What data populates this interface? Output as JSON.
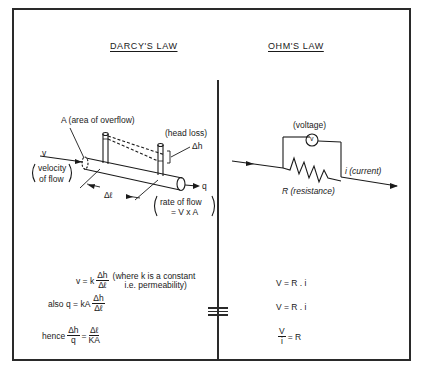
{
  "left_panel": {
    "title": "DARCY'S LAW",
    "labels": {
      "area": "A (area of overflow)",
      "head_loss": "(head loss)",
      "delta_h": "Δh",
      "velocity_symbol": "v",
      "velocity_desc_1": "velocity",
      "velocity_desc_2": "of flow",
      "delta_l": "Δℓ",
      "flow_symbol": "q",
      "flow_desc_1": "rate of flow",
      "flow_desc_2": "= V x A"
    },
    "equations": {
      "eq1_lhs": "v = k",
      "eq1_num": "Δh",
      "eq1_den": "Δℓ",
      "eq1_note_1": "(where k is a constant",
      "eq1_note_2": "i.e. permeability)",
      "eq2_prefix": "also",
      "eq2_lhs": "q = kA",
      "eq2_num": "Δh",
      "eq2_den": "Δℓ",
      "eq3_prefix": "hence",
      "eq3_lnum": "Δh",
      "eq3_lden": "q",
      "eq3_eq": "=",
      "eq3_rnum": "Δℓ",
      "eq3_rden": "KA"
    }
  },
  "right_panel": {
    "title": "OHM'S LAW",
    "labels": {
      "voltage": "(voltage)",
      "voltmeter_symbol": "v",
      "current": "i (current)",
      "resistance": "R (resistance)"
    },
    "equations": {
      "eq1": "V = R . i",
      "eq2": "V = R . i",
      "eq3_num": "V",
      "eq3_den": "i",
      "eq3_rhs": "= R"
    }
  },
  "equivalence_symbol": "≡",
  "colors": {
    "ink": "#1a1a1a",
    "background": "#ffffff"
  }
}
